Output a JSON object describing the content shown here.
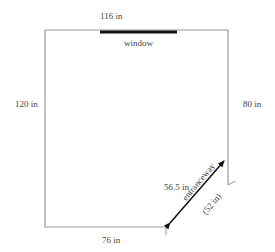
{
  "diagram": {
    "type": "floor-plan",
    "labels": {
      "top_wall": "116 in",
      "window": "window",
      "left_wall": "120 in",
      "right_wall": "80 in",
      "bottom_wall": "76 in",
      "diagonal": "56.5 in",
      "entranceway": "entranceway",
      "entranceway_width": "(52 in)"
    },
    "colors": {
      "wall": "#9a9a9a",
      "window": "#111111",
      "arrow": "#111111",
      "text": "#444444"
    }
  }
}
